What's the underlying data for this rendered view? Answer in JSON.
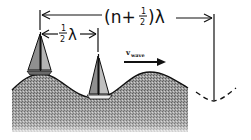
{
  "diagram": {
    "title": "",
    "labels": {
      "long_span": "(n + ½)λ",
      "long_span_prefix": "(n+",
      "long_span_frac_num": "1",
      "long_span_frac_den": "2",
      "long_span_suffix": ")λ",
      "short_span_frac_num": "1",
      "short_span_frac_den": "2",
      "short_span_symbol": "λ",
      "velocity_symbol": "v",
      "velocity_subscript": "wave"
    },
    "elements": [
      {
        "id": "water-wave",
        "type": "shaded sinusoidal water surface"
      },
      {
        "id": "sailboat-crest",
        "position": "on wave crest (left)"
      },
      {
        "id": "sailboat-trough",
        "position": "in wave trough, half wavelength to the right"
      },
      {
        "id": "dashed-trough-extension",
        "position": "dashed continuation at far right trough"
      }
    ],
    "colors": {
      "ink": "#111111",
      "water_fill": "#8a8a8a",
      "sail": "#9a9a9a"
    }
  }
}
